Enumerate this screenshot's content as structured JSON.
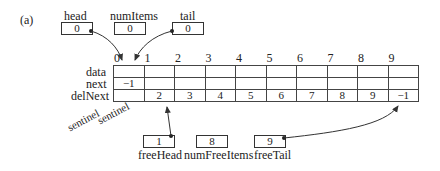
{
  "figure_label": "(a)",
  "head": {
    "label": "head",
    "value": "0"
  },
  "numItems": {
    "label": "numItems",
    "value": "0"
  },
  "tail": {
    "label": "tail",
    "value": "0"
  },
  "row_labels": [
    "data",
    "next",
    "delNext"
  ],
  "indices": [
    "0",
    "1",
    "2",
    "3",
    "4",
    "5",
    "6",
    "7",
    "8",
    "9"
  ],
  "data": [
    "",
    "",
    "",
    "",
    "",
    "",
    "",
    "",
    "",
    ""
  ],
  "next": [
    "-1",
    "",
    "",
    "",
    "",
    "",
    "",
    "",
    "",
    ""
  ],
  "delNext": [
    "",
    "2",
    "3",
    "4",
    "5",
    "6",
    "7",
    "8",
    "9",
    "-1"
  ],
  "sentinel_labels": [
    "sentinel",
    "sentinel"
  ],
  "freeHead": {
    "label": "freeHead",
    "value": "1"
  },
  "numFreeItems": {
    "label": "numFreeItems",
    "value": "8"
  },
  "freeTail": {
    "label": "freeTail",
    "value": "9"
  }
}
